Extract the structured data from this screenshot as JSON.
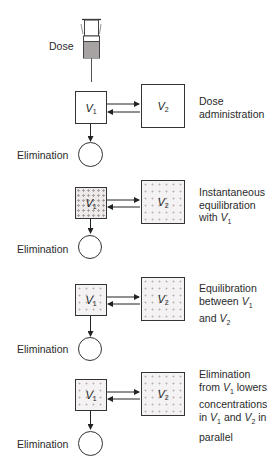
{
  "diagram": {
    "dose_label": "Dose",
    "elimination_label": "Elimination",
    "v1_symbol": "V",
    "v1_subscript": "1",
    "v2_symbol": "V",
    "v2_subscript": "2",
    "stages": [
      {
        "id": "dose-administration",
        "v1_fill": "empty",
        "v2_fill": "empty",
        "elimination_fill": "empty",
        "description": [
          "Dose",
          "administration"
        ]
      },
      {
        "id": "instantaneous-equilibration",
        "v1_fill": "dotted",
        "v2_fill": "dotted-sparse",
        "elimination_fill": "dotted-sparse",
        "description": [
          "Instantaneous",
          "equilibration",
          "with V1"
        ]
      },
      {
        "id": "equilibration-between",
        "v1_fill": "dotted",
        "v2_fill": "dotted",
        "elimination_fill": "dotted",
        "description": [
          "Equilibration",
          "between V1",
          "and V2"
        ]
      },
      {
        "id": "elimination-lowers",
        "v1_fill": "dotted-sparse",
        "v2_fill": "dotted-sparse",
        "elimination_fill": "dotted-dense",
        "description": [
          "Elimination",
          "from V1 lowers",
          "concentrations",
          "in V1 and V2 in",
          "parallel"
        ]
      }
    ]
  },
  "text": {
    "s1_l1": "Dose",
    "s1_l2": "administration",
    "s2_l1": "Instantaneous",
    "s2_l2": "equilibration",
    "s2_l3a": "with ",
    "s3_l1": "Equilibration",
    "s3_l2a": "between ",
    "s3_l3a": "and ",
    "s4_l1": "Elimination",
    "s4_l2a": "from ",
    "s4_l2b": " lowers",
    "s4_l3": "concentrations",
    "s4_l4a": "in ",
    "s4_l4b": " and ",
    "s4_l4c": " in",
    "s4_l5": "parallel",
    "V": "V",
    "sub1": "1",
    "sub2": "2"
  }
}
